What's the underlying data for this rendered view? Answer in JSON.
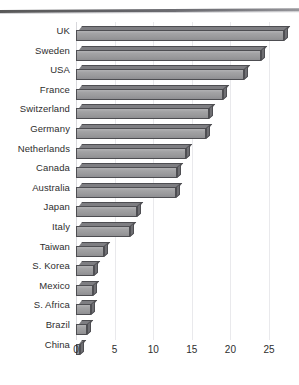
{
  "chart_data": {
    "type": "bar",
    "orientation": "horizontal",
    "title": "",
    "subtitle": "",
    "xlabel": "",
    "ylabel": "",
    "xlim": [
      0,
      27.5
    ],
    "xticks": [
      0,
      5,
      10,
      15,
      20,
      25
    ],
    "xtick_labels": [
      "0",
      "5",
      "10",
      "15",
      "20",
      "25"
    ],
    "grid": true,
    "grid_axis": "x",
    "legend": null,
    "categories": [
      "UK",
      "Sweden",
      "USA",
      "France",
      "Switzerland",
      "Germany",
      "Netherlands",
      "Canada",
      "Australia",
      "Japan",
      "Italy",
      "Taiwan",
      "S. Korea",
      "Mexico",
      "S. Africa",
      "Brazil",
      "China"
    ],
    "values": [
      27.0,
      24.0,
      21.8,
      19.0,
      17.2,
      16.8,
      14.2,
      13.1,
      13.0,
      7.9,
      7.0,
      3.6,
      2.3,
      2.2,
      1.9,
      1.4,
      0.5
    ],
    "series": [
      {
        "name": "",
        "values": [
          27.0,
          24.0,
          21.8,
          19.0,
          17.2,
          16.8,
          14.2,
          13.1,
          13.0,
          7.9,
          7.0,
          3.6,
          2.3,
          2.2,
          1.9,
          1.4,
          0.5
        ]
      }
    ],
    "bar_style": "3d-rectangular",
    "colors": {
      "bar_face": "#9a9a9c",
      "bar_top": "#7e7e82",
      "bar_side": "#6f6f73",
      "bar_outline": "#4e4e52",
      "gridline": "#e9e9ec",
      "axis_text": "#2e2e2e",
      "background": "#ffffff",
      "top_rule": "#55555a"
    }
  }
}
